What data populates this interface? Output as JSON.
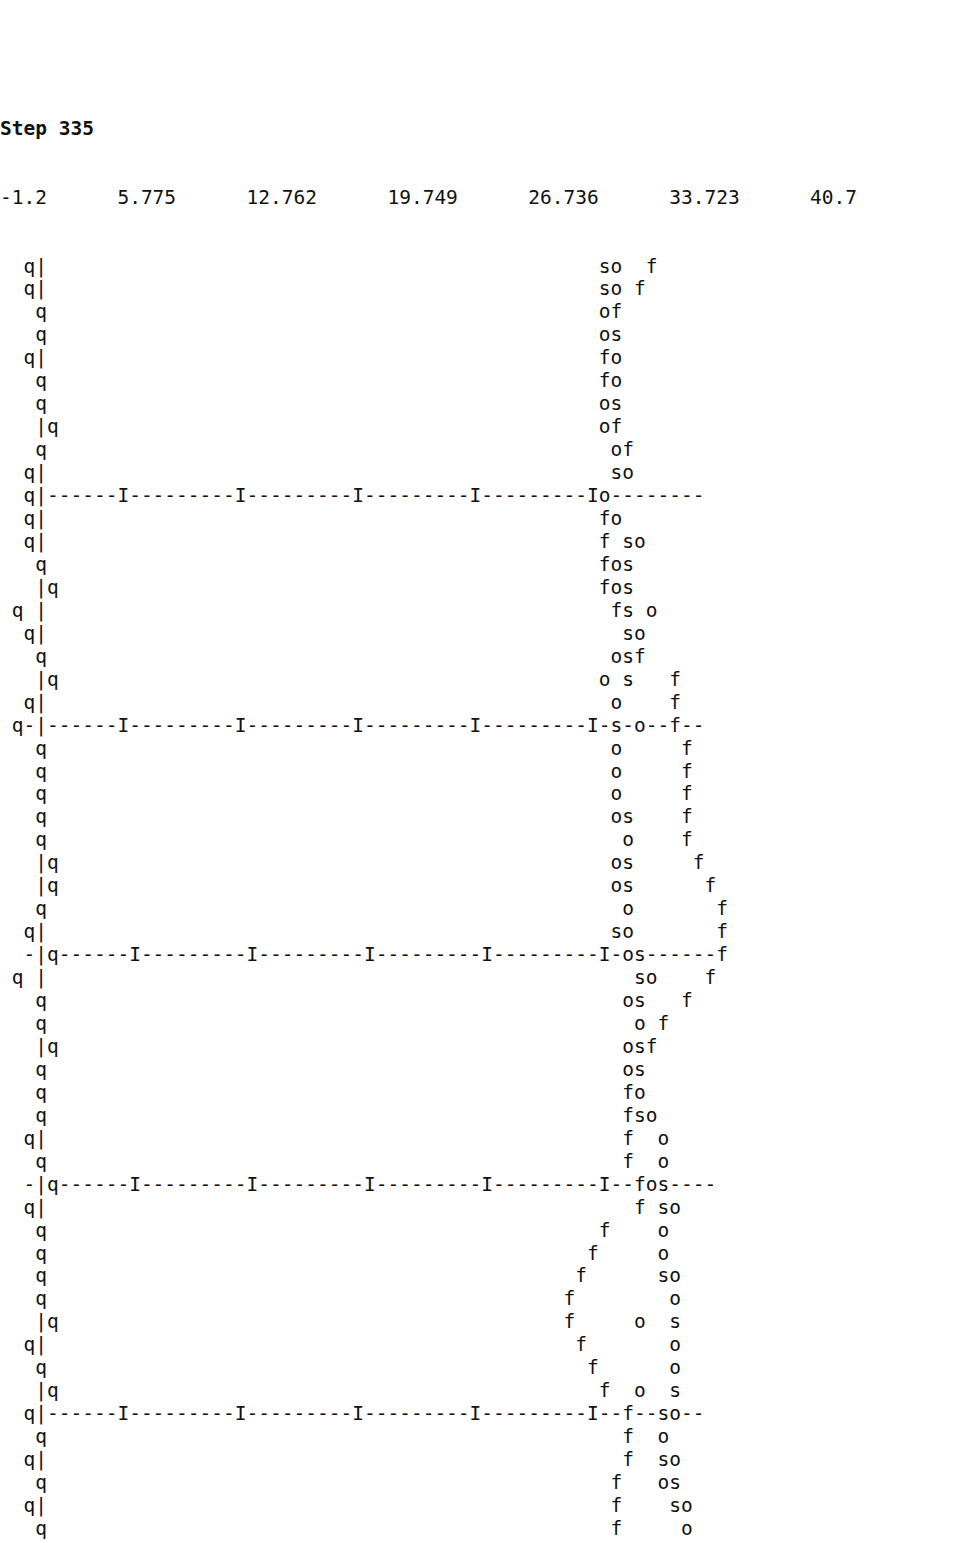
{
  "meta": {
    "kind": "ascii-terminal-plot",
    "background_color": "#ffffff",
    "text_color": "#111111",
    "char_width_px": 14.52,
    "char_height_px": 22.96,
    "columns": 67,
    "plot_rows": 57
  },
  "title": {
    "text": "Step 335",
    "step_label": "Step",
    "step_value": "335"
  },
  "axis": {
    "tick_row_text": "-1.2      5.775      12.762      19.749      26.736      33.723      40.7",
    "tick_labels": [
      "-1.2",
      "5.775",
      "12.762",
      "19.749",
      "26.736",
      "33.723",
      "40.7"
    ],
    "tick_marker_glyph": "I",
    "vertical_axis_glyph": "|",
    "dash_glyph": "-",
    "x_min": -1.2,
    "x_max": 40.7,
    "tick_step": 6.987
  },
  "legend": {
    "series_glyphs": [
      "q",
      "s",
      "o",
      "f"
    ],
    "series_names": [
      "q-series",
      "s-series",
      "o-series",
      "f-series"
    ]
  },
  "chart_data": {
    "type": "scatter",
    "title": "Step 335",
    "xlabel": "",
    "ylabel": "",
    "xlim": [
      -1.2,
      40.7
    ],
    "grid": true,
    "legend_position": "none",
    "tick_labels": [
      "-1.2",
      "5.775",
      "12.762",
      "19.749",
      "26.736",
      "33.723",
      "40.7"
    ],
    "tick_values": [
      -1.2,
      5.775,
      12.762,
      19.749,
      26.736,
      33.723,
      40.7
    ],
    "symbols": [
      "q",
      "s",
      "o",
      "f"
    ],
    "gridline_rows": [
      10,
      21,
      32,
      43,
      54
    ],
    "rows": [
      "  q|                                               so  f",
      "  q|                                               so f",
      "   q                                               of",
      "   q                                               os",
      "  q|                                               fo",
      "   q                                               fo",
      "   q                                               os",
      "   |q                                              of",
      "   q                                                of",
      "  q|                                                so",
      "  q|------I---------I---------I---------I---------Io--------",
      "  q|                                               fo",
      "  q|                                               f so",
      "   q                                               fos",
      "   |q                                              fos",
      " q |                                                fs o",
      "  q|                                                 so",
      "   q                                                osf",
      "   |q                                              o s   f",
      "  q|                                                o    f",
      " q-|------I---------I---------I---------I---------I-s-o--f--",
      "   q                                                o     f",
      "   q                                                o     f",
      "   q                                                o     f",
      "   q                                                os    f",
      "   q                                                 o    f",
      "   |q                                               os     f",
      "   |q                                               os      f",
      "   q                                                 o       f",
      "  q|                                                so       f",
      "  -|q------I---------I---------I---------I---------I-os------f",
      " q |                                                  so    f",
      "   q                                                 os   f",
      "   q                                                  o f",
      "   |q                                                osf",
      "   q                                                 os",
      "   q                                                 fo",
      "   q                                                 fso",
      "  q|                                                 f  o",
      "   q                                                 f  o",
      "  -|q------I---------I---------I---------I---------I--fos----",
      "  q|                                                  f so",
      "   q                                               f    o",
      "   q                                              f     o",
      "   q                                             f      so",
      "   q                                            f        o",
      "   |q                                           f     o  s",
      "  q|                                             f       o",
      "   q                                              f      o",
      "   |q                                              f  o  s",
      "  q|------I---------I---------I---------I---------I--f--so--",
      "   q                                                 f  o",
      "  q|                                                 f  so",
      "   q                                                f   os",
      "  q|                                                f    so",
      "   q                                                f     o"
    ]
  }
}
